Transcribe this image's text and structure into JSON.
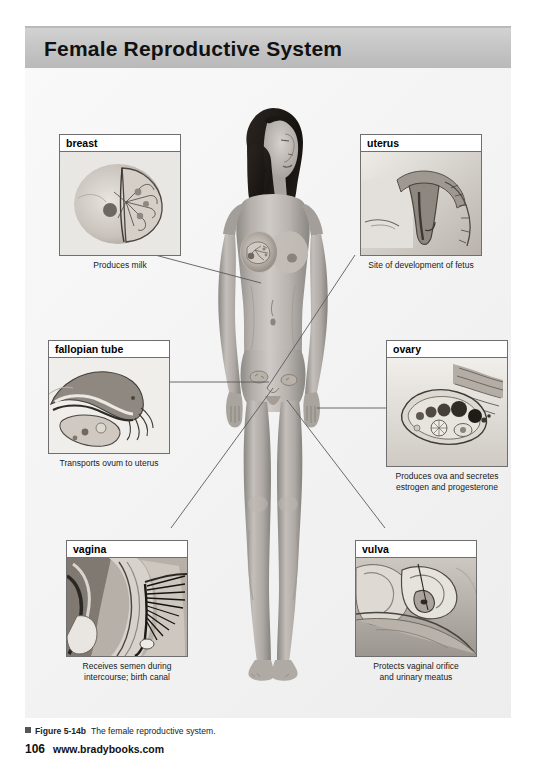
{
  "page": {
    "title": "Female Reproductive System",
    "page_number": "106",
    "website": "www.bradybooks.com",
    "figure_number": "Figure 5-14b",
    "figure_caption": "The female reproductive system.",
    "colors": {
      "banner_gray": "#c6c6c6",
      "page_background": "#f2f2f2",
      "box_border": "#6f6f6f",
      "leader_line": "#555555",
      "text": "#111111"
    }
  },
  "callouts": [
    {
      "id": "breast",
      "label": "breast",
      "caption": "Produces milk",
      "caption_lines": [
        "Produces milk"
      ],
      "position": "top-left"
    },
    {
      "id": "uterus",
      "label": "uterus",
      "caption": "Site of development of fetus",
      "caption_lines": [
        "Site of development of fetus"
      ],
      "position": "top-right"
    },
    {
      "id": "fallopian-tube",
      "label": "fallopian tube",
      "caption": "Transports ovum to uterus",
      "caption_lines": [
        "Transports ovum to uterus"
      ],
      "position": "middle-left"
    },
    {
      "id": "ovary",
      "label": "ovary",
      "caption": "Produces ova and secretes estrogen and progesterone",
      "caption_lines": [
        "Produces ova and secretes",
        "estrogen and progesterone"
      ],
      "position": "middle-right"
    },
    {
      "id": "vagina",
      "label": "vagina",
      "caption": "Receives semen during intercourse; birth canal",
      "caption_lines": [
        "Receives semen during",
        "intercourse; birth canal"
      ],
      "position": "bottom-left"
    },
    {
      "id": "vulva",
      "label": "vulva",
      "caption": "Protects vaginal orifice and urinary meatus",
      "caption_lines": [
        "Protects vaginal orifice",
        "and urinary meatus"
      ],
      "position": "bottom-right"
    }
  ],
  "central_figure": {
    "description": "grayscale anatomical illustration of a standing nude female figure, front view, with dark long hair"
  }
}
